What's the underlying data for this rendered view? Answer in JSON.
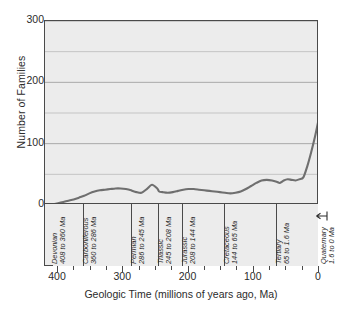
{
  "chart_data": {
    "type": "line",
    "title": "",
    "xlabel": "Geologic Time (millions of years ago, Ma)",
    "ylabel": "Number of Families",
    "xlim": [
      420,
      0
    ],
    "ylim": [
      0,
      300
    ],
    "x_major_ticks": [
      400,
      300,
      200,
      100,
      0
    ],
    "x_minor_tick_step": 25,
    "y_major_ticks": [
      0,
      100,
      200,
      300
    ],
    "y_minor_ticks": [
      50,
      150,
      250
    ],
    "grid": "horizontal",
    "series_name": "Number of Families",
    "line_color": "#6f6f6f",
    "plot_background": "#ececec",
    "x": [
      408,
      400,
      392,
      384,
      376,
      368,
      360,
      352,
      344,
      336,
      328,
      320,
      312,
      304,
      296,
      288,
      286,
      280,
      272,
      264,
      256,
      248,
      245,
      240,
      232,
      224,
      216,
      208,
      200,
      192,
      184,
      176,
      168,
      160,
      152,
      144,
      136,
      128,
      120,
      112,
      104,
      96,
      88,
      80,
      72,
      65,
      60,
      54,
      48,
      42,
      36,
      30,
      24,
      18,
      12,
      6,
      2,
      0
    ],
    "y": [
      1,
      3,
      5,
      7,
      9,
      12,
      15,
      19,
      22,
      24,
      25,
      26,
      27,
      27,
      26,
      24,
      23,
      21,
      20,
      26,
      33,
      27,
      22,
      21,
      20,
      21,
      23,
      25,
      26,
      26,
      25,
      24,
      23,
      22,
      21,
      20,
      19,
      20,
      22,
      26,
      31,
      36,
      40,
      41,
      40,
      38,
      36,
      40,
      42,
      41,
      40,
      42,
      45,
      63,
      86,
      112,
      132,
      141
    ]
  },
  "periods": [
    {
      "name": "Devonian",
      "range": "408 to 360 Ma",
      "start": 408,
      "end": 360
    },
    {
      "name": "Carboniferous",
      "range": "360 to 286 Ma",
      "start": 360,
      "end": 286
    },
    {
      "name": "Permian",
      "range": "286 to 245 Ma",
      "start": 286,
      "end": 245
    },
    {
      "name": "Triassic",
      "range": "245 to 208 Ma",
      "start": 245,
      "end": 208
    },
    {
      "name": "Jurassic",
      "range": "208 to 144 Ma",
      "start": 208,
      "end": 144
    },
    {
      "name": "Cretaceous",
      "range": "144 to 65 Ma",
      "start": 144,
      "end": 65
    },
    {
      "name": "Tertiary",
      "range": "65 to 1.6 Ma",
      "start": 65,
      "end": 1.6
    }
  ],
  "quaternary": {
    "name": "Quaternary",
    "range": "1.6 to 0 Ma"
  }
}
